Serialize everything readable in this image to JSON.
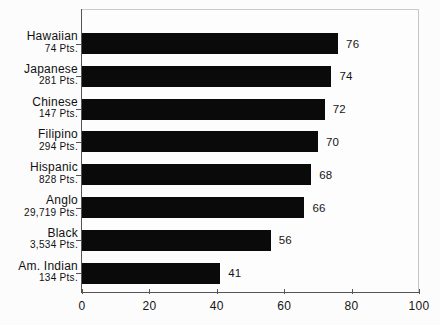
{
  "chart_data": {
    "type": "bar",
    "orientation": "horizontal",
    "title": "",
    "subtitle": "",
    "xlabel": "",
    "ylabel": "",
    "xlim": [
      0,
      100
    ],
    "xticks": [
      "0",
      "20",
      "40",
      "60",
      "80",
      "100"
    ],
    "grid": false,
    "legend": null,
    "categories": [
      "Hawaiian",
      "Japanese",
      "Chinese",
      "Filipino",
      "Hispanic",
      "Anglo",
      "Black",
      "Am. Indian"
    ],
    "category_sublabels": [
      "74 Pts.",
      "281 Pts.",
      "147 Pts.",
      "294 Pts.",
      "828 Pts.",
      "29,719 Pts.",
      "3,534 Pts.",
      "134 Pts."
    ],
    "values": [
      76,
      74,
      72,
      70,
      68,
      66,
      56,
      41
    ],
    "value_labels": [
      "76",
      "74",
      "72",
      "70",
      "68",
      "66",
      "56",
      "41"
    ],
    "bar_color": "#0a0a0a",
    "axis_color": "#555555",
    "background_color": "#fdfdfd"
  }
}
